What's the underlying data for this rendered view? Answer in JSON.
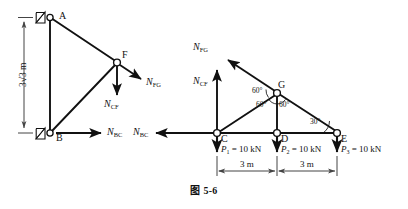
{
  "figure": {
    "caption": "图 5-6",
    "caption_icon": "figure-caption",
    "stroke_color": "#111111",
    "background_color": "#ffffff",
    "dimension_color": "#555555"
  },
  "left_fbd": {
    "name": "left-free-body-diagram",
    "nodes": [
      {
        "id": "A",
        "label": "A",
        "x": 50,
        "y": 17,
        "support": "pin"
      },
      {
        "id": "B",
        "label": "B",
        "x": 50,
        "y": 133,
        "support": "pin"
      },
      {
        "id": "F",
        "label": "F",
        "x": 117,
        "y": 62,
        "support": "none"
      }
    ],
    "members": [
      {
        "from": "A",
        "to": "B"
      },
      {
        "from": "A",
        "to": "F"
      },
      {
        "from": "B",
        "to": "F"
      }
    ],
    "forces": [
      {
        "id": "N_FG",
        "label": "N",
        "sub": "FG",
        "direction": "down-right",
        "at": "F"
      },
      {
        "id": "N_CF",
        "label": "N",
        "sub": "CF",
        "direction": "down",
        "at": "F"
      },
      {
        "id": "N_BC",
        "label": "N",
        "sub": "BC",
        "direction": "right",
        "at": "B"
      }
    ],
    "dimension": {
      "label": "3√3 m",
      "value": "3",
      "unit": "m",
      "orientation": "vertical"
    }
  },
  "right_fbd": {
    "name": "right-free-body-diagram",
    "nodes": [
      {
        "id": "C",
        "label": "C",
        "x": 217,
        "y": 133
      },
      {
        "id": "D",
        "label": "D",
        "x": 277,
        "y": 133
      },
      {
        "id": "E",
        "label": "E",
        "x": 337,
        "y": 133
      },
      {
        "id": "G",
        "label": "G",
        "x": 277,
        "y": 93
      }
    ],
    "members": [
      {
        "from": "C",
        "to": "E"
      },
      {
        "from": "C",
        "to": "G"
      },
      {
        "from": "D",
        "to": "G"
      },
      {
        "from": "E",
        "to": "G"
      }
    ],
    "forces": [
      {
        "id": "N_FG",
        "label": "N",
        "sub": "FG",
        "direction": "up-left",
        "at": "G"
      },
      {
        "id": "N_CF",
        "label": "N",
        "sub": "CF",
        "direction": "up",
        "at": "C"
      },
      {
        "id": "N_BC",
        "label": "N",
        "sub": "BC",
        "direction": "left",
        "at": "C"
      }
    ],
    "angles": [
      {
        "id": "angle-g-left",
        "label": "60°",
        "vertex": "G"
      },
      {
        "id": "angle-g-mid-left",
        "label": "60°",
        "vertex": "G"
      },
      {
        "id": "angle-g-mid-right",
        "label": "60°",
        "vertex": "G"
      },
      {
        "id": "angle-e",
        "label": "30°",
        "vertex": "E"
      }
    ],
    "loads": [
      {
        "id": "P1",
        "symbol": "P",
        "sub": "1",
        "eq": " = 10 kN",
        "at": "C",
        "value": 10,
        "unit": "kN"
      },
      {
        "id": "P2",
        "symbol": "P",
        "sub": "2",
        "eq": " = 10 kN",
        "at": "D",
        "value": 10,
        "unit": "kN"
      },
      {
        "id": "P3",
        "symbol": "P",
        "sub": "3",
        "eq": " = 10 kN",
        "at": "E",
        "value": 10,
        "unit": "kN"
      }
    ],
    "dimensions": [
      {
        "id": "dim-cd",
        "label": "3 m",
        "from": "C",
        "to": "D"
      },
      {
        "id": "dim-de",
        "label": "3 m",
        "from": "D",
        "to": "E"
      }
    ]
  }
}
